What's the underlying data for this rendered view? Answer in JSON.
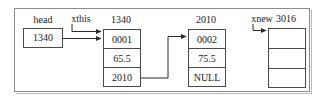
{
  "diagram": {
    "title_caption_head": "head",
    "pointers": [
      {
        "name": "xthis-pointer-label",
        "label": "xthis"
      },
      {
        "name": "xnew-pointer-label",
        "label": "xnew"
      }
    ],
    "head_variable": {
      "label": "head",
      "value": "1340"
    },
    "nodes": [
      {
        "id": "node-1340",
        "address_label": "1340",
        "cells": [
          "0001",
          "65.5",
          "2010"
        ]
      },
      {
        "id": "node-2010",
        "address_label": "2010",
        "cells": [
          "0002",
          "75.5",
          "NULL"
        ]
      },
      {
        "id": "node-3016",
        "address_label": "3016",
        "cells": [
          "",
          "",
          ""
        ]
      }
    ],
    "colors": {
      "stroke": "#4a4a4a",
      "frame": "#8c8c8c",
      "text": "#1a1a1a",
      "background": "#ffffff"
    }
  }
}
